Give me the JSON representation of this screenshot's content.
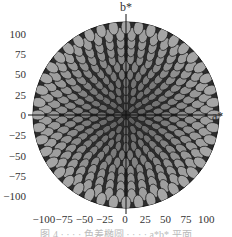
{
  "chart_data": {
    "type": "scatter",
    "title": "",
    "xlabel": "a*",
    "ylabel": "b*",
    "xlim": [
      -115,
      115
    ],
    "ylim": [
      -115,
      115
    ],
    "x_ticks": [
      -100,
      -75,
      -50,
      -25,
      0,
      25,
      50,
      75,
      100
    ],
    "y_ticks": [
      100,
      75,
      50,
      25,
      0,
      -25,
      -50,
      -75,
      -100
    ],
    "x_tick_labels": [
      "−100",
      "−75",
      "−50",
      "−25",
      "0",
      "25",
      "50",
      "75",
      "100"
    ],
    "y_tick_labels": [
      "100",
      "75",
      "50",
      "25",
      "0",
      "−25",
      "−50",
      "−75",
      "−100"
    ],
    "grid": false,
    "legend": null,
    "shape": {
      "type": "disk",
      "center": [
        0,
        0
      ],
      "radius": 115
    },
    "rings": [
      {
        "radius": 10,
        "count": 8
      },
      {
        "radius": 20,
        "count": 14
      },
      {
        "radius": 30,
        "count": 20
      },
      {
        "radius": 40,
        "count": 26
      },
      {
        "radius": 50,
        "count": 30
      },
      {
        "radius": 60,
        "count": 34
      },
      {
        "radius": 70,
        "count": 38
      },
      {
        "radius": 80,
        "count": 40
      },
      {
        "radius": 90,
        "count": 42
      },
      {
        "radius": 100,
        "count": 44
      },
      {
        "radius": 109,
        "count": 44
      }
    ]
  },
  "caption": "图 4 · · · · 色差椭圆 · · · · a*b* 平面"
}
